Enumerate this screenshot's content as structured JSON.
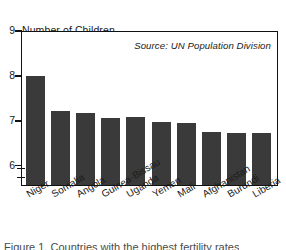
{
  "chart_data": {
    "type": "bar",
    "title": "",
    "ylabel": "Number of Children Per Woman",
    "ylabel_line1": "Number of Children",
    "ylabel_line2": "Per Woman",
    "xlabel": "",
    "source_note": "Source: UN Population Division",
    "ylim": [
      5.55,
      9
    ],
    "yticks": [
      9,
      8,
      7,
      6
    ],
    "ytick_labels": [
      "9",
      "8",
      "7",
      "6"
    ],
    "grid": false,
    "legend": "none",
    "axis_break": true,
    "bar_color": "#3a3a3a",
    "frame_color": "#111111",
    "categories": [
      "Niger",
      "Somalia",
      "Angola",
      "Guinea-Bissau",
      "Uganda",
      "Yemen",
      "Mali",
      "Afghanistan",
      "Burundi",
      "Liberia"
    ],
    "values": [
      8.0,
      7.23,
      7.17,
      7.07,
      7.08,
      6.97,
      6.95,
      6.75,
      6.74,
      6.73
    ]
  },
  "caption": {
    "text": "Figure 1. Countries with the highest fertility rates"
  }
}
